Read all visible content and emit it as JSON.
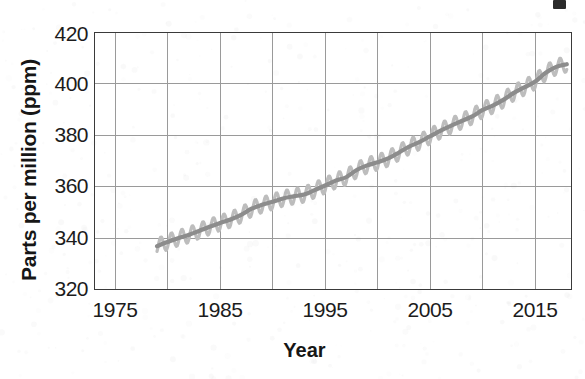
{
  "chart_data": {
    "type": "line",
    "title": "",
    "subtitle": "",
    "xlabel": "Year",
    "ylabel": "Parts per million (ppm)",
    "xlim": [
      1973,
      2018.5
    ],
    "ylim": [
      320,
      420
    ],
    "xticks": [
      1975,
      1985,
      1995,
      2005,
      2015
    ],
    "xtick_labels": [
      "1975",
      "1985",
      "1995",
      "2005",
      "2015"
    ],
    "yticks": [
      320,
      340,
      360,
      380,
      400,
      420
    ],
    "ytick_labels": [
      "320",
      "340",
      "360",
      "380",
      "400",
      "420"
    ],
    "gridline_years": [
      1975,
      1980,
      1985,
      1990,
      1995,
      2000,
      2005,
      2010,
      2015
    ],
    "grid": true,
    "legend": "none",
    "annotations": [],
    "series": [
      {
        "name": "Atmospheric CO2 concentration (annual trend)",
        "color": "#8a8a8a",
        "style": "smooth-trend",
        "x": [
          1979,
          1980,
          1981,
          1982,
          1983,
          1984,
          1985,
          1986,
          1987,
          1988,
          1989,
          1990,
          1991,
          1992,
          1993,
          1994,
          1995,
          1996,
          1997,
          1998,
          1999,
          2000,
          2001,
          2002,
          2003,
          2004,
          2005,
          2006,
          2007,
          2008,
          2009,
          2010,
          2011,
          2012,
          2013,
          2014,
          2015,
          2016,
          2017,
          2018
        ],
        "values": [
          337.0,
          338.6,
          340.1,
          341.3,
          342.9,
          344.5,
          346.0,
          347.3,
          349.1,
          351.5,
          353.0,
          354.2,
          355.5,
          356.3,
          357.0,
          358.7,
          360.5,
          362.4,
          363.7,
          366.5,
          368.3,
          369.5,
          371.0,
          373.2,
          375.6,
          377.4,
          379.6,
          381.8,
          383.7,
          385.5,
          387.3,
          389.8,
          391.6,
          393.8,
          396.5,
          398.6,
          400.8,
          404.2,
          406.5,
          407.5
        ]
      },
      {
        "name": "Monthly measurements with seasonal oscillation",
        "color": "#b8b8b8",
        "style": "sawtooth-envelope",
        "seasonal_amplitude_ppm": 3.0,
        "cycles_per_year": 1
      }
    ]
  },
  "figure": {
    "cutoff_mark": "partial-cropped-title-mark"
  }
}
